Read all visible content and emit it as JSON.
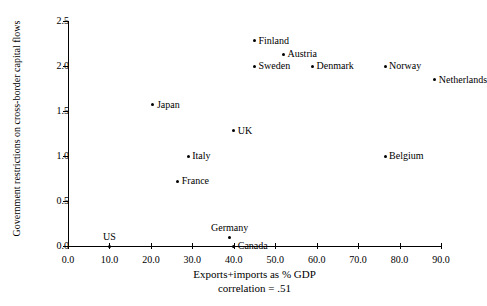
{
  "chart_data": {
    "type": "scatter",
    "title": "",
    "xlabel": "Exports+imports as % GDP",
    "ylabel": "Government restrictions on cross-border capital flows",
    "annotation": "correlation = .51",
    "xlim": [
      0,
      90
    ],
    "ylim": [
      0,
      2.5
    ],
    "xticks": [
      "0.0",
      "10.0",
      "20.0",
      "30.0",
      "40.0",
      "50.0",
      "60.0",
      "70.0",
      "80.0",
      "90.0"
    ],
    "xtick_values": [
      0,
      10,
      20,
      30,
      40,
      50,
      60,
      70,
      80,
      90
    ],
    "yticks": [
      "0.0",
      "0.5",
      "1.0",
      "1.5",
      "2.0",
      "2.5"
    ],
    "ytick_values": [
      0,
      0.5,
      1.0,
      1.5,
      2.0,
      2.5
    ],
    "grid": false,
    "legend": false,
    "marker_color": "#000000",
    "points": [
      {
        "label": "Finland",
        "x": 45.0,
        "y": 2.28,
        "label_pos": "right"
      },
      {
        "label": "Austria",
        "x": 52.0,
        "y": 2.13,
        "label_pos": "right"
      },
      {
        "label": "Sweden",
        "x": 45.0,
        "y": 2.0,
        "label_pos": "right"
      },
      {
        "label": "Denmark",
        "x": 59.0,
        "y": 2.0,
        "label_pos": "right"
      },
      {
        "label": "Norway",
        "x": 76.5,
        "y": 2.0,
        "label_pos": "right"
      },
      {
        "label": "Netherlands",
        "x": 88.5,
        "y": 1.85,
        "label_pos": "right"
      },
      {
        "label": "Japan",
        "x": 20.5,
        "y": 1.57,
        "label_pos": "right"
      },
      {
        "label": "UK",
        "x": 40.0,
        "y": 1.28,
        "label_pos": "right"
      },
      {
        "label": "Italy",
        "x": 29.0,
        "y": 1.0,
        "label_pos": "right"
      },
      {
        "label": "Belgium",
        "x": 76.5,
        "y": 1.0,
        "label_pos": "right"
      },
      {
        "label": "France",
        "x": 26.5,
        "y": 0.72,
        "label_pos": "right"
      },
      {
        "label": "Germany",
        "x": 39.0,
        "y": 0.1,
        "label_pos": "above"
      },
      {
        "label": "Canada",
        "x": 40.0,
        "y": 0.0,
        "label_pos": "right"
      },
      {
        "label": "US",
        "x": 10.0,
        "y": 0.0,
        "label_pos": "above"
      }
    ]
  }
}
